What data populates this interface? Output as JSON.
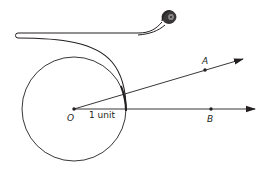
{
  "diagram": {
    "labels": {
      "center": "O",
      "radius": "1 unit",
      "point_a": "A",
      "point_b": "B"
    },
    "colors": {
      "stroke": "#231f20",
      "background": "#ffffff"
    },
    "elements": [
      {
        "id": "unit-circle",
        "type": "circle",
        "center": [
          74,
          109
        ],
        "radius": 52
      },
      {
        "id": "ray-oa",
        "type": "ray",
        "from": [
          74,
          109
        ],
        "through": [
          205,
          70
        ],
        "tip": [
          243,
          59
        ]
      },
      {
        "id": "ray-ob",
        "type": "ray",
        "from": [
          74,
          109
        ],
        "through": [
          211,
          109
        ],
        "tip": [
          255,
          109
        ]
      },
      {
        "id": "tape-strip",
        "type": "path",
        "note": "measuring tape unrolling from a spool, wrapping onto the circle"
      },
      {
        "id": "tape-roll",
        "type": "spool",
        "center": [
          169,
          17
        ]
      }
    ]
  }
}
